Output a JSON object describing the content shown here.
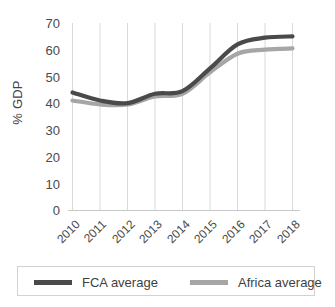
{
  "chart_data": {
    "type": "line",
    "title": "",
    "subtitle": "",
    "xlabel": "",
    "ylabel": "% GDP",
    "x": [
      2010,
      2011,
      2012,
      2013,
      2014,
      2015,
      2016,
      2017,
      2018
    ],
    "categories": [
      "2010",
      "2011",
      "2012",
      "2013",
      "2014",
      "2015",
      "2016",
      "2017",
      "2018"
    ],
    "series": [
      {
        "name": "FCA average",
        "color": "#4a4a4a",
        "values": [
          44,
          41,
          40,
          43.5,
          44.5,
          53,
          62,
          64.5,
          65
        ]
      },
      {
        "name": "Africa average",
        "color": "#a6a6a6",
        "values": [
          41,
          39.5,
          39.5,
          42.5,
          43.5,
          51.5,
          58.5,
          60,
          60.5
        ]
      }
    ],
    "ylim": [
      0,
      70
    ],
    "y_ticks": [
      0,
      10,
      20,
      30,
      40,
      50,
      60,
      70
    ],
    "y_tick_labels": [
      "0",
      "10",
      "20",
      "30",
      "40",
      "50",
      "60",
      "70"
    ],
    "grid": {
      "vertical": true,
      "horizontal": false
    },
    "legend": {
      "position": "bottom",
      "bordered": true
    },
    "axis_color": "#bfbfbf",
    "gridline_color": "#d9d9d9"
  },
  "legend": {
    "entries": [
      {
        "label": "FCA average",
        "color": "#4a4a4a"
      },
      {
        "label": "Africa average",
        "color": "#a6a6a6"
      }
    ]
  }
}
